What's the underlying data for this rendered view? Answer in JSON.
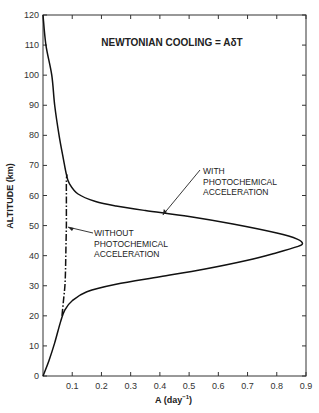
{
  "chart_data": {
    "type": "line",
    "title": "NEWTONIAN COOLING = AδT",
    "xlabel": "A (day⁻¹)",
    "ylabel": "ALTITUDE (km)",
    "xlim": [
      0,
      0.9
    ],
    "ylim": [
      0,
      120
    ],
    "xticks": [
      "0.1",
      "0.2",
      "0.3",
      "0.4",
      "0.5",
      "0.6",
      "0.7",
      "0.8",
      "0.9"
    ],
    "yticks": [
      "0",
      "10",
      "20",
      "30",
      "40",
      "50",
      "60",
      "70",
      "80",
      "90",
      "100",
      "110",
      "120"
    ],
    "grid": false,
    "series": [
      {
        "name": "WITH PHOTOCHEMICAL ACCELERATION",
        "style": "solid",
        "points": [
          [
            0.0,
            0
          ],
          [
            0.02,
            5
          ],
          [
            0.04,
            11
          ],
          [
            0.06,
            18
          ],
          [
            0.075,
            22
          ],
          [
            0.1,
            25
          ],
          [
            0.15,
            28
          ],
          [
            0.25,
            30.5
          ],
          [
            0.4,
            33
          ],
          [
            0.55,
            35.5
          ],
          [
            0.7,
            38.5
          ],
          [
            0.8,
            41
          ],
          [
            0.87,
            43
          ],
          [
            0.888,
            44
          ],
          [
            0.87,
            45.5
          ],
          [
            0.8,
            47.5
          ],
          [
            0.65,
            50.5
          ],
          [
            0.5,
            53
          ],
          [
            0.35,
            55
          ],
          [
            0.25,
            56.5
          ],
          [
            0.18,
            58
          ],
          [
            0.12,
            60.5
          ],
          [
            0.09,
            64
          ],
          [
            0.08,
            67
          ],
          [
            0.07,
            72
          ],
          [
            0.055,
            80
          ],
          [
            0.04,
            90
          ],
          [
            0.03,
            100
          ],
          [
            0.01,
            110
          ],
          [
            0.0,
            120
          ]
        ]
      },
      {
        "name": "WITHOUT PHOTOCHEMICAL ACCELERATION",
        "style": "dash-dot",
        "points": [
          [
            0.065,
            20
          ],
          [
            0.07,
            25
          ],
          [
            0.075,
            30
          ],
          [
            0.077,
            35
          ],
          [
            0.078,
            40
          ],
          [
            0.079,
            45
          ],
          [
            0.08,
            50
          ],
          [
            0.08,
            55
          ],
          [
            0.08,
            60
          ],
          [
            0.08,
            65
          ],
          [
            0.082,
            67
          ]
        ]
      }
    ],
    "annotations": [
      {
        "text": [
          "WITH",
          "PHOTOCHEMICAL",
          "ACCELERATION"
        ],
        "arrow_to": [
          0.41,
          53.5
        ]
      },
      {
        "text": [
          "WITHOUT",
          "PHOTOCHEMICAL",
          "ACCELERATION"
        ],
        "arrow_to": [
          0.082,
          49.5
        ]
      }
    ]
  },
  "labels": {
    "title": "NEWTONIAN COOLING = AδT",
    "xlabel": "A (day",
    "xlabel_sup": "−1",
    "xlabel_close": ")",
    "ylabel": "ALTITUDE (km)",
    "with": [
      "WITH",
      "PHOTOCHEMICAL",
      "ACCELERATION"
    ],
    "without": [
      "WITHOUT",
      "PHOTOCHEMICAL",
      "ACCELERATION"
    ]
  }
}
